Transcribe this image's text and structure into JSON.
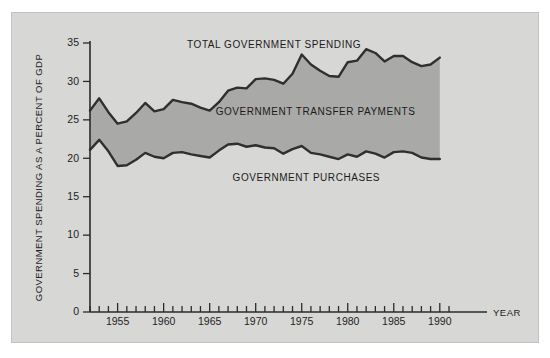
{
  "figure": {
    "background_color": "#ffffff",
    "panel_color": "#d7d7d5",
    "band_color": "#a9a9a7",
    "line_color": "#2f2f2f"
  },
  "chart_data": {
    "type": "area",
    "title": "",
    "subtitle": "",
    "xlabel": "Year",
    "ylabel": "Government Spending as a Percent of GDP",
    "xlim": [
      1952,
      1991
    ],
    "ylim": [
      0,
      35
    ],
    "grid": false,
    "legend_position": "inline-annotations",
    "y_ticks": [
      0,
      5,
      10,
      15,
      20,
      25,
      30,
      35
    ],
    "y_tick_labels": [
      "0",
      "5",
      "10",
      "15",
      "20",
      "25",
      "30",
      "35"
    ],
    "x_ticks": [
      1955,
      1960,
      1965,
      1970,
      1975,
      1980,
      1985,
      1990
    ],
    "x_tick_labels": [
      "1955",
      "1960",
      "1965",
      "1970",
      "1975",
      "1980",
      "1985",
      "1990"
    ],
    "x_minor_tick_step": 1,
    "annotations": [
      {
        "name": "total-government-spending-label",
        "text": "Total Government Spending",
        "x": 1972.0,
        "y": 34.3
      },
      {
        "name": "government-transfer-payments-label",
        "text": "Government Transfer Payments",
        "x": 1976.5,
        "y": 25.6
      },
      {
        "name": "government-purchases-label",
        "text": "Government Purchases",
        "x": 1975.5,
        "y": 17.0
      }
    ],
    "x": [
      1952,
      1953,
      1954,
      1955,
      1956,
      1957,
      1958,
      1959,
      1960,
      1961,
      1962,
      1963,
      1964,
      1965,
      1966,
      1967,
      1968,
      1969,
      1970,
      1971,
      1972,
      1973,
      1974,
      1975,
      1976,
      1977,
      1978,
      1979,
      1980,
      1981,
      1982,
      1983,
      1984,
      1985,
      1986,
      1987,
      1988,
      1989,
      1990
    ],
    "series": [
      {
        "name": "Total Government Spending",
        "role": "upper-boundary",
        "values": [
          26.2,
          27.8,
          26.0,
          24.5,
          24.8,
          25.9,
          27.2,
          26.1,
          26.4,
          27.6,
          27.3,
          27.1,
          26.6,
          26.2,
          27.3,
          28.8,
          29.2,
          29.1,
          30.3,
          30.4,
          30.2,
          29.7,
          31.0,
          33.5,
          32.2,
          31.4,
          30.7,
          30.6,
          32.5,
          32.7,
          34.2,
          33.7,
          32.6,
          33.3,
          33.3,
          32.5,
          32.0,
          32.2,
          33.1
        ]
      },
      {
        "name": "Government Purchases",
        "role": "lower-boundary",
        "values": [
          21.1,
          22.4,
          20.9,
          19.0,
          19.1,
          19.8,
          20.7,
          20.2,
          20.0,
          20.7,
          20.8,
          20.5,
          20.3,
          20.1,
          21.0,
          21.8,
          21.9,
          21.5,
          21.7,
          21.4,
          21.3,
          20.6,
          21.2,
          21.6,
          20.7,
          20.5,
          20.2,
          19.9,
          20.5,
          20.2,
          20.9,
          20.6,
          20.1,
          20.8,
          20.9,
          20.7,
          20.1,
          19.9,
          19.9
        ]
      }
    ],
    "filled_region": {
      "name": "Government Transfer Payments",
      "between": [
        "Total Government Spending",
        "Government Purchases"
      ]
    }
  }
}
